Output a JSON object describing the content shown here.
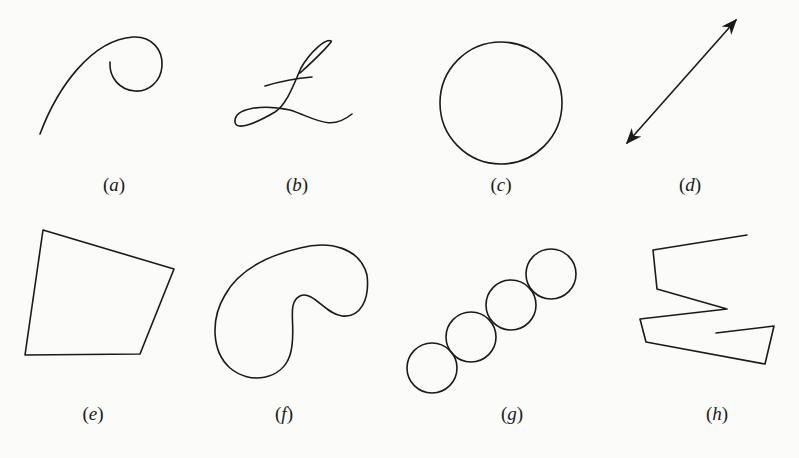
{
  "figure": {
    "panels": [
      {
        "id": "a",
        "label": "(a)",
        "letter": "a",
        "description": "open curve ending in a spiral"
      },
      {
        "id": "b",
        "label": "(b)",
        "letter": "b",
        "description": "self-intersecting curve (cursive L)"
      },
      {
        "id": "c",
        "label": "(c)",
        "letter": "c",
        "description": "circle"
      },
      {
        "id": "d",
        "label": "(d)",
        "letter": "d",
        "description": "line with arrowheads at both ends"
      },
      {
        "id": "e",
        "label": "(e)",
        "letter": "e",
        "description": "quadrilateral (closed polygon)"
      },
      {
        "id": "f",
        "label": "(f)",
        "letter": "f",
        "description": "closed kidney-shaped curve"
      },
      {
        "id": "g",
        "label": "(g)",
        "letter": "g",
        "description": "chain of four tangent circles"
      },
      {
        "id": "h",
        "label": "(h)",
        "letter": "h",
        "description": "open zigzag polyline"
      }
    ],
    "stroke_color": "#1a1a1a",
    "background": "#fbfbfa"
  }
}
